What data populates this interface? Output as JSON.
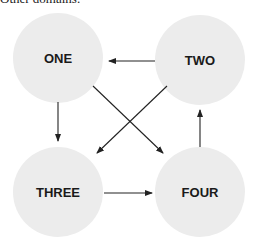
{
  "caption": "Other domains.",
  "colors": {
    "node_fill": "#ececec",
    "edge": "#222222",
    "text": "#1a1a1a"
  },
  "nodes": [
    {
      "id": "one",
      "label": "ONE",
      "cx": 58,
      "cy": 58,
      "r": 45
    },
    {
      "id": "two",
      "label": "TWO",
      "cx": 200,
      "cy": 60,
      "r": 45
    },
    {
      "id": "three",
      "label": "THREE",
      "cx": 58,
      "cy": 192,
      "r": 45
    },
    {
      "id": "four",
      "label": "FOUR",
      "cx": 200,
      "cy": 192,
      "r": 45
    }
  ],
  "edges": [
    {
      "from": "TWO",
      "to": "ONE"
    },
    {
      "from": "ONE",
      "to": "THREE"
    },
    {
      "from": "THREE",
      "to": "FOUR"
    },
    {
      "from": "FOUR",
      "to": "TWO"
    },
    {
      "from": "ONE",
      "to": "FOUR"
    },
    {
      "from": "TWO",
      "to": "THREE"
    }
  ]
}
